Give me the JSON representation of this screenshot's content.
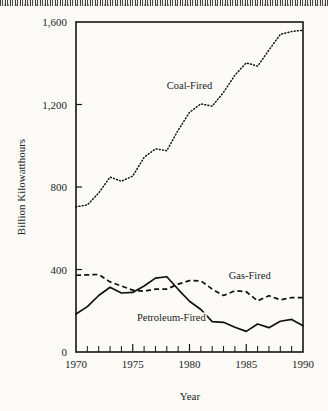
{
  "figure": {
    "background_color": "#fbfaf7",
    "ink_color": "#161616"
  },
  "chart_data": {
    "type": "line",
    "title": "",
    "xlabel": "Year",
    "ylabel": "Billion Kilowatthours",
    "xlim": [
      1970,
      1990
    ],
    "ylim": [
      0,
      1600
    ],
    "grid": false,
    "legend": "inline-labels",
    "y_ticks": [
      0,
      400,
      800,
      1200,
      1600
    ],
    "y_tick_labels": [
      "0",
      "400",
      "800",
      "1,200",
      "1,600"
    ],
    "x_ticks": [
      1970,
      1975,
      1980,
      1985,
      1990
    ],
    "x_tick_labels": [
      "1970",
      "1975",
      "1980",
      "1985",
      "1990"
    ],
    "x_minor_tick_step": 1,
    "x": [
      1970,
      1971,
      1972,
      1973,
      1974,
      1975,
      1976,
      1977,
      1978,
      1979,
      1980,
      1981,
      1982,
      1983,
      1984,
      1985,
      1986,
      1987,
      1988,
      1989,
      1990
    ],
    "series": [
      {
        "name": "Coal-Fired",
        "style": "dotted",
        "label_text": "Coal-Fired",
        "values": [
          704,
          713,
          771,
          848,
          828,
          853,
          944,
          985,
          976,
          1075,
          1162,
          1203,
          1192,
          1259,
          1342,
          1402,
          1386,
          1464,
          1540,
          1554,
          1560
        ]
      },
      {
        "name": "Gas-Fired",
        "style": "dashed",
        "label_text": "Gas-Fired",
        "values": [
          372,
          374,
          376,
          340,
          320,
          300,
          295,
          305,
          305,
          329,
          346,
          345,
          305,
          274,
          297,
          292,
          248,
          273,
          253,
          264,
          264
        ]
      },
      {
        "name": "Petroleum-Fired",
        "style": "solid",
        "label_text": "Petroleum-Fired",
        "values": [
          184,
          220,
          274,
          314,
          286,
          289,
          320,
          358,
          365,
          304,
          246,
          206,
          147,
          144,
          120,
          100,
          136,
          118,
          149,
          158,
          127
        ]
      }
    ],
    "annotations": [
      {
        "text": "Coal-Fired",
        "x": 1980.0,
        "y": 1275
      },
      {
        "text": "Gas-Fired",
        "x": 1985.3,
        "y": 355
      },
      {
        "text": "Petroleum-Fired",
        "x": 1978.4,
        "y": 148
      }
    ]
  }
}
